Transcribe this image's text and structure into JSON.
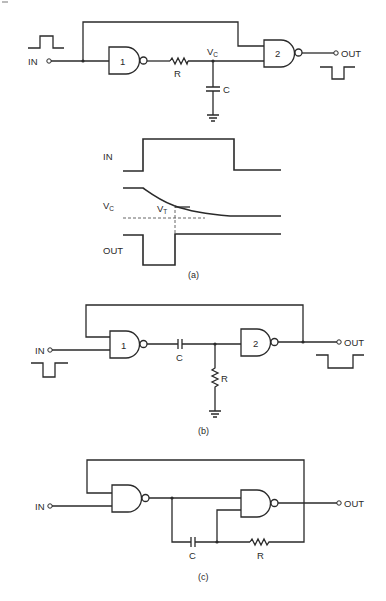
{
  "figure": {
    "panel_a": {
      "caption": "(a)",
      "input_label": "IN",
      "output_label": "OUT",
      "gate1_label": "1",
      "gate2_label": "2",
      "resistor_label": "R",
      "capacitor_label": "C",
      "node_label": "V",
      "node_label_sub": "C",
      "timing": {
        "in_label": "IN",
        "vc_label": "V",
        "vc_label_sub": "C",
        "vt_label": "V",
        "vt_label_sub": "T",
        "out_label": "OUT"
      }
    },
    "panel_b": {
      "caption": "(b)",
      "input_label": "IN",
      "output_label": "OUT",
      "gate1_label": "1",
      "gate2_label": "2",
      "capacitor_label": "C",
      "resistor_label": "R"
    },
    "panel_c": {
      "caption": "(c)",
      "input_label": "IN",
      "output_label": "OUT",
      "capacitor_label": "C",
      "resistor_label": "R"
    }
  },
  "colors": {
    "ink": "#2a2a2a",
    "background": "#ffffff"
  }
}
